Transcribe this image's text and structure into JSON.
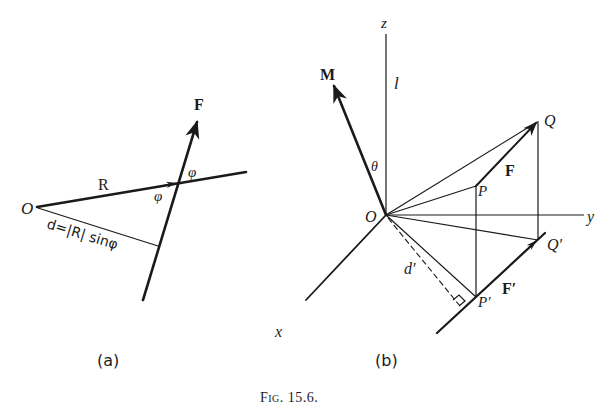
{
  "figure": {
    "caption": "Fig. 15.6.",
    "panel_a": {
      "label": "(a)",
      "point_O": "O",
      "vector_R": "R",
      "vector_F": "F",
      "angle_upper": "φ",
      "angle_lower": "φ",
      "distance_formula": "d=|R| sinφ"
    },
    "panel_b": {
      "label": "(b)",
      "axis_z": "z",
      "axis_y": "y",
      "axis_x": "x",
      "line_l": "l",
      "vector_M": "M",
      "angle_theta": "θ",
      "origin_O": "O",
      "point_P": "P",
      "point_Q": "Q",
      "point_P_prime": "P′",
      "point_Q_prime": "Q′",
      "vector_F": "F",
      "vector_F_prime": "F′",
      "distance_d_prime": "d′"
    }
  }
}
